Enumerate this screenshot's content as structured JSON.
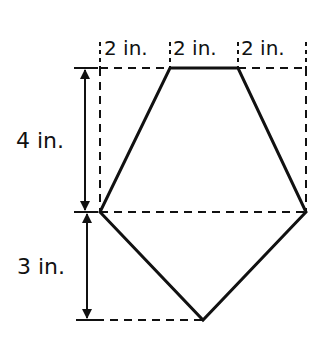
{
  "diagram": {
    "type": "pentagon-composite-figure",
    "top_labels": [
      "2 in.",
      "2 in.",
      "2 in."
    ],
    "side_labels": {
      "upper": "4 in.",
      "lower": "3 in."
    },
    "colors": {
      "stroke": "#111111",
      "background": "#ffffff"
    },
    "shapes": {
      "trapezoid": {
        "top_width_in": 2,
        "bottom_width_in": 6,
        "height_in": 4
      },
      "triangle": {
        "base_in": 6,
        "height_in": 3
      }
    }
  }
}
